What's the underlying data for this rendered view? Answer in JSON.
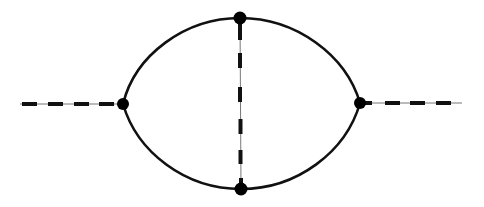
{
  "diagram": {
    "type": "feynman-diagram",
    "colors": {
      "line": "#111111",
      "thin_line": "#777777",
      "vertex": "#000000",
      "background": "#ffffff"
    },
    "vertices": [
      {
        "id": "left",
        "x": 123,
        "y": 104,
        "r": 6
      },
      {
        "id": "right",
        "x": 360,
        "y": 103,
        "r": 6
      },
      {
        "id": "top",
        "x": 240,
        "y": 18,
        "r": 6.5
      },
      {
        "id": "bottom",
        "x": 241,
        "y": 189,
        "r": 6.5
      }
    ],
    "edges": [
      {
        "id": "external-left",
        "style": "dashed",
        "from": [
          20,
          104
        ],
        "to": "left"
      },
      {
        "id": "external-right",
        "style": "dashed",
        "from": "right",
        "to": [
          462,
          103
        ]
      },
      {
        "id": "upper-arc",
        "style": "solid",
        "from": "left",
        "to": "right",
        "via": "top"
      },
      {
        "id": "lower-arc",
        "style": "solid",
        "from": "left",
        "to": "right",
        "via": "bottom"
      },
      {
        "id": "internal-vertical",
        "style": "dashed",
        "from": "top",
        "to": "bottom"
      }
    ]
  }
}
